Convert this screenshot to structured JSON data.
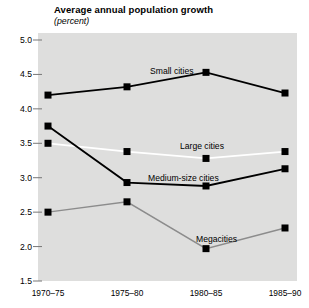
{
  "chart_data": {
    "type": "line",
    "title": "Average annual population growth",
    "subtitle": "(percent)",
    "xlabel": "",
    "ylabel": "",
    "ylim": [
      1.5,
      5.0
    ],
    "yticks": [
      "5.0",
      "4.5",
      "4.0",
      "3.5",
      "3.0",
      "2.5",
      "2.0",
      "1.5"
    ],
    "ytick_values": [
      5.0,
      4.5,
      4.0,
      3.5,
      3.0,
      2.5,
      2.0,
      1.5
    ],
    "grid": false,
    "legend": "inline-annotations",
    "categories": [
      "1970–75",
      "1975–80",
      "1980–85",
      "1985–90"
    ],
    "series": [
      {
        "name": "Small cities",
        "color": "#000000",
        "values": [
          4.2,
          4.32,
          4.53,
          4.23
        ],
        "label_x": 150,
        "label_y": 66
      },
      {
        "name": "Large cities",
        "color": "#ffffff",
        "values": [
          3.5,
          3.38,
          3.28,
          3.38
        ],
        "label_x": 180,
        "label_y": 141
      },
      {
        "name": "Medium-size cities",
        "color": "#000000",
        "values": [
          3.75,
          2.93,
          2.88,
          3.13
        ],
        "label_x": 148,
        "label_y": 173
      },
      {
        "name": "Megacities",
        "color": "#8c8c8c",
        "values": [
          2.5,
          2.65,
          1.97,
          2.27
        ],
        "label_x": 196,
        "label_y": 234
      }
    ]
  },
  "colors": {
    "plot_background": "#dededd",
    "page_background": "#ffffff",
    "axis_text": "#000000",
    "tick_mark": "#777777"
  }
}
